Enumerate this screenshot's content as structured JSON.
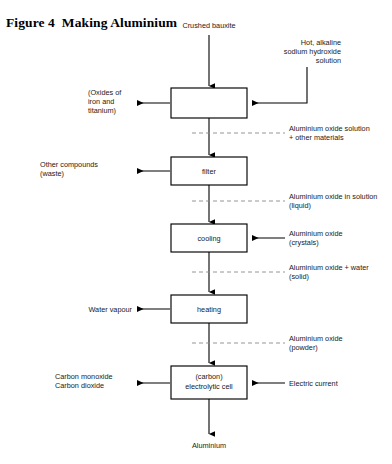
{
  "figure": {
    "title": "Figure 4  Making Aluminium"
  },
  "flow": {
    "inputs": {
      "top": "Crushed bauxite",
      "bottom_output": "Aluminium"
    },
    "boxes": [
      {
        "id": "digestion",
        "lines": []
      },
      {
        "id": "filter",
        "lines": [
          "filter"
        ]
      },
      {
        "id": "cooling",
        "lines": [
          "cooling"
        ]
      },
      {
        "id": "heating",
        "lines": [
          "heating"
        ]
      },
      {
        "id": "electrolytic-cell",
        "lines": [
          "(carbon)",
          "electrolytic cell"
        ]
      }
    ],
    "side_inputs": [
      {
        "id": "sodium-hydroxide",
        "lines": [
          "Hot, alkaline",
          "sodium hydroxide",
          "solution"
        ],
        "align": "right"
      },
      {
        "id": "aluminium-oxide-crystals",
        "lines": [
          "Aluminium oxide",
          "(crystals)"
        ],
        "align": "left"
      },
      {
        "id": "electric-current",
        "lines": [
          "Electric current"
        ],
        "align": "left"
      }
    ],
    "side_outputs": [
      {
        "id": "oxides-iron-titanium",
        "lines": [
          "(Oxides of",
          "iron and",
          "titanium)"
        ],
        "align": "left"
      },
      {
        "id": "other-compounds-waste",
        "lines": [
          "Other compounds",
          "(waste)"
        ],
        "align": "left"
      },
      {
        "id": "water-vapour",
        "lines": [
          "Water vapour"
        ],
        "align": "right"
      },
      {
        "id": "carbon-oxides",
        "lines": [
          "Carbon monoxide",
          "Carbon dioxide"
        ],
        "align": "left"
      }
    ],
    "stream_labels": [
      {
        "id": "stream-1",
        "lines": [
          "Aluminium oxide solution",
          "+ other materials"
        ]
      },
      {
        "id": "stream-2",
        "lines": [
          "Aluminium oxide in solution",
          "(liquid)"
        ]
      },
      {
        "id": "stream-3",
        "lines": [
          "Aluminium oxide + water",
          "(solid)"
        ]
      },
      {
        "id": "stream-4",
        "lines": [
          "Aluminium oxide",
          "(powder)"
        ]
      }
    ]
  },
  "colors": {
    "background": "#ffffff",
    "ink": "#000000",
    "text": "#1a1a1a",
    "dashed_line": "#8a8a8a"
  }
}
